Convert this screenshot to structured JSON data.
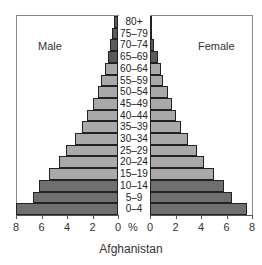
{
  "chart_data": {
    "type": "bar",
    "subtype": "population-pyramid",
    "title": "Afghanistan",
    "xlabel": "%",
    "categories": [
      "0–4",
      "5–9",
      "10–14",
      "15–19",
      "20–24",
      "25–29",
      "30–34",
      "35–39",
      "40–44",
      "45–49",
      "50–54",
      "55–59",
      "60–64",
      "65–69",
      "70–74",
      "75–79",
      "80+"
    ],
    "series": [
      {
        "name": "Male",
        "values": [
          8.0,
          6.7,
          6.2,
          5.4,
          4.6,
          4.1,
          3.4,
          2.8,
          2.4,
          2.0,
          1.6,
          1.3,
          1.0,
          0.8,
          0.6,
          0.5,
          0.3
        ]
      },
      {
        "name": "Female",
        "values": [
          7.6,
          6.4,
          5.8,
          5.0,
          4.2,
          3.7,
          3.0,
          2.4,
          2.0,
          1.7,
          1.4,
          1.0,
          0.9,
          0.6,
          0.3,
          0.15,
          0.1
        ]
      }
    ],
    "xlim": [
      0,
      8
    ],
    "xticks": [
      8,
      6,
      4,
      2,
      0
    ],
    "xticks_female": [
      0,
      2,
      4,
      6,
      8
    ],
    "grid": false,
    "group_colors": {
      "0-14": "#6f6f6f",
      "15-64": "#a9a9a9",
      "65+": "#5a5a5a"
    }
  },
  "labels": {
    "male": "Male",
    "female": "Female",
    "title": "Afghanistan",
    "pct": "%"
  }
}
